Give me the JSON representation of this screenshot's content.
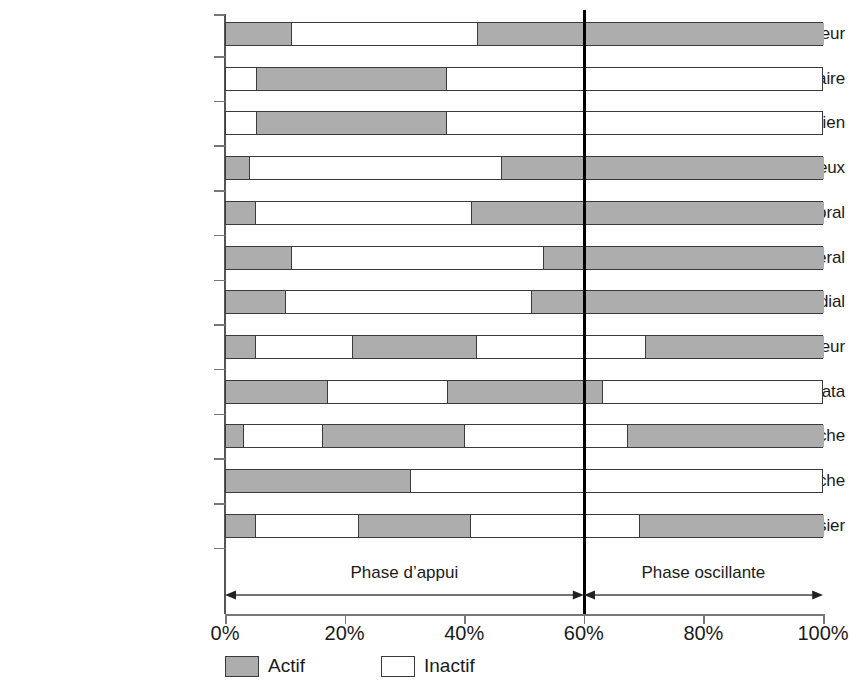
{
  "chart_data": {
    "type": "bar",
    "chart_style": "stacked-horizontal-timeline",
    "title": "",
    "xlabel": "",
    "ylabel": "",
    "xlim": [
      0,
      100
    ],
    "xtick_labels": [
      "0%",
      "20%",
      "40%",
      "60%",
      "80%",
      "100%"
    ],
    "xticks": [
      0,
      20,
      40,
      60,
      80,
      100
    ],
    "grid": false,
    "legend": {
      "position": "bottom-left",
      "entries": [
        {
          "label": "Actif",
          "state": "active",
          "color": "#adadad"
        },
        {
          "label": "Inactif",
          "state": "inactive",
          "color": "#ffffff"
        }
      ]
    },
    "annotations": [
      {
        "label": "Phase d’appui",
        "from": 0,
        "to": 60,
        "center": 30
      },
      {
        "label": "Phase oscillante",
        "from": 60,
        "to": 100,
        "center": 80
      }
    ],
    "marker_lines": [
      {
        "value": 60,
        "label": "",
        "color": "#000000"
      }
    ],
    "categories": [
      "Tibial antérieur",
      "Soléaire",
      "Gastrocnémien",
      "Semi-membraneux",
      "Biceps fémoral",
      "Vaste latéral",
      "Vaste médial",
      "Droit antérieur",
      "Tenseur du fascia lata",
      "Adducteurs de la hanche",
      "Abducteurs de la hanche",
      "Grand fessier"
    ],
    "series": [
      {
        "name": "Tibial antérieur",
        "segments": [
          {
            "state": "active",
            "start": 0,
            "end": 11
          },
          {
            "state": "inactive",
            "start": 11,
            "end": 42
          },
          {
            "state": "active",
            "start": 42,
            "end": 100
          }
        ]
      },
      {
        "name": "Soléaire",
        "segments": [
          {
            "state": "inactive",
            "start": 0,
            "end": 5
          },
          {
            "state": "active",
            "start": 5,
            "end": 37
          },
          {
            "state": "inactive",
            "start": 37,
            "end": 100
          }
        ]
      },
      {
        "name": "Gastrocnémien",
        "segments": [
          {
            "state": "inactive",
            "start": 0,
            "end": 5
          },
          {
            "state": "active",
            "start": 5,
            "end": 37
          },
          {
            "state": "inactive",
            "start": 37,
            "end": 100
          }
        ]
      },
      {
        "name": "Semi-membraneux",
        "segments": [
          {
            "state": "active",
            "start": 0,
            "end": 4
          },
          {
            "state": "inactive",
            "start": 4,
            "end": 46
          },
          {
            "state": "active",
            "start": 46,
            "end": 100
          }
        ]
      },
      {
        "name": "Biceps fémoral",
        "segments": [
          {
            "state": "active",
            "start": 0,
            "end": 5
          },
          {
            "state": "inactive",
            "start": 5,
            "end": 41
          },
          {
            "state": "active",
            "start": 41,
            "end": 100
          }
        ]
      },
      {
        "name": "Vaste latéral",
        "segments": [
          {
            "state": "active",
            "start": 0,
            "end": 11
          },
          {
            "state": "inactive",
            "start": 11,
            "end": 53
          },
          {
            "state": "active",
            "start": 53,
            "end": 100
          }
        ]
      },
      {
        "name": "Vaste médial",
        "segments": [
          {
            "state": "active",
            "start": 0,
            "end": 10
          },
          {
            "state": "inactive",
            "start": 10,
            "end": 51
          },
          {
            "state": "active",
            "start": 51,
            "end": 100
          }
        ]
      },
      {
        "name": "Droit antérieur",
        "segments": [
          {
            "state": "active",
            "start": 0,
            "end": 5
          },
          {
            "state": "inactive",
            "start": 5,
            "end": 21
          },
          {
            "state": "active",
            "start": 21,
            "end": 42
          },
          {
            "state": "inactive",
            "start": 42,
            "end": 70
          },
          {
            "state": "active",
            "start": 70,
            "end": 100
          }
        ]
      },
      {
        "name": "Tenseur du fascia lata",
        "segments": [
          {
            "state": "active",
            "start": 0,
            "end": 17
          },
          {
            "state": "inactive",
            "start": 17,
            "end": 37
          },
          {
            "state": "active",
            "start": 37,
            "end": 63
          },
          {
            "state": "inactive",
            "start": 63,
            "end": 100
          }
        ]
      },
      {
        "name": "Adducteurs de la hanche",
        "segments": [
          {
            "state": "active",
            "start": 0,
            "end": 3
          },
          {
            "state": "inactive",
            "start": 3,
            "end": 16
          },
          {
            "state": "active",
            "start": 16,
            "end": 40
          },
          {
            "state": "inactive",
            "start": 40,
            "end": 67
          },
          {
            "state": "active",
            "start": 67,
            "end": 100
          }
        ]
      },
      {
        "name": "Abducteurs de la hanche",
        "segments": [
          {
            "state": "active",
            "start": 0,
            "end": 31
          },
          {
            "state": "inactive",
            "start": 31,
            "end": 100
          }
        ]
      },
      {
        "name": "Grand fessier",
        "segments": [
          {
            "state": "active",
            "start": 0,
            "end": 5
          },
          {
            "state": "inactive",
            "start": 5,
            "end": 22
          },
          {
            "state": "active",
            "start": 22,
            "end": 41
          },
          {
            "state": "inactive",
            "start": 41,
            "end": 69
          },
          {
            "state": "active",
            "start": 69,
            "end": 100
          }
        ]
      }
    ]
  }
}
